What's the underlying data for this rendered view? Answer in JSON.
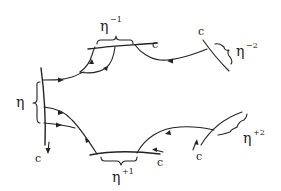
{
  "diagram": {
    "labels": {
      "eta": "η",
      "eta_minus_1": "η",
      "eta_minus_1_sup": "−1",
      "eta_minus_2": "η",
      "eta_minus_2_sup": "−2",
      "eta_plus_1": "η",
      "eta_plus_1_sup": "+1",
      "eta_plus_2": "η",
      "eta_plus_2_sup": "+2",
      "c_top_middle": "c",
      "c_top_right": "c",
      "c_bottom_left": "c",
      "c_bottom_middle": "c",
      "c_bottom_right": "c"
    }
  }
}
